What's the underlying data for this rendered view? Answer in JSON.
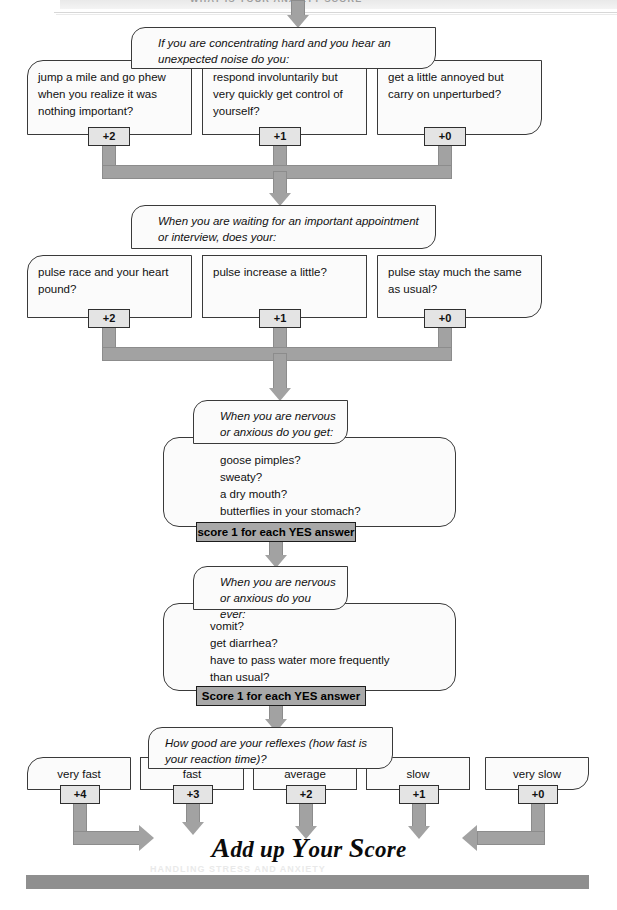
{
  "page": {
    "header_text": "WHAT IS YOUR ANXIETY SCORE",
    "footer_ghost_text": "HANDLING STRESS AND ANXIETY",
    "headline": {
      "full": "Add up Your Score",
      "parts": [
        {
          "cap": "A",
          "rest": "dd"
        },
        {
          "cap": "",
          "rest": "up"
        },
        {
          "cap": "Y",
          "rest": "our"
        },
        {
          "cap": "S",
          "rest": "core"
        }
      ]
    }
  },
  "questions": [
    {
      "id": "noise",
      "prompt": "If you are concentrating hard and you hear an unexpected noise do you:",
      "answers": [
        {
          "text": "jump a mile and go phew when you realize it was nothing important?",
          "score": "+2"
        },
        {
          "text": "respond involuntarily but very quickly get control of yourself?",
          "score": "+1"
        },
        {
          "text": "get a little annoyed but carry on unperturbed?",
          "score": "+0"
        }
      ]
    },
    {
      "id": "appointment",
      "prompt": "When you are waiting for an important appointment or interview, does your:",
      "answers": [
        {
          "text": "pulse race and your heart pound?",
          "score": "+2"
        },
        {
          "text": "pulse increase a little?",
          "score": "+1"
        },
        {
          "text": "pulse stay much the same as usual?",
          "score": "+0"
        }
      ]
    },
    {
      "id": "nervous-get",
      "prompt": "When you are nervous or anxious do you get:",
      "items": [
        "goose pimples?",
        "sweaty?",
        "a dry mouth?",
        "butterflies in your stomach?"
      ],
      "score_bar": "score 1 for each YES answer"
    },
    {
      "id": "nervous-ever",
      "prompt": "When you are nervous or anxious do you ever:",
      "items": [
        "vomit?",
        "get diarrhea?",
        "have to pass water more frequently",
        "than usual?"
      ],
      "score_bar": "Score 1 for each YES answer"
    },
    {
      "id": "reflexes",
      "prompt": "How good are your reflexes (how fast is your reaction time)?",
      "answers": [
        {
          "text": "very fast",
          "score": "+4"
        },
        {
          "text": "fast",
          "score": "+3"
        },
        {
          "text": "average",
          "score": "+2"
        },
        {
          "text": "slow",
          "score": "+1"
        },
        {
          "text": "very slow",
          "score": "+0"
        }
      ]
    }
  ],
  "colors": {
    "connector_gray": "#a2a2a2",
    "score_bar_gray": "#a8a8a8",
    "chip_gray": "#e4e4e4",
    "box_fill": "#fbfbfb",
    "outline": "#3a3a3a",
    "footer_bar": "#8f8f8f"
  }
}
